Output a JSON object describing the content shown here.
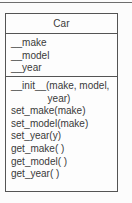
{
  "diagram": {
    "type": "uml-class-diagram",
    "top_rule_color": "#6e6e6e",
    "border_color": "#545454",
    "text_color": "#3a3a3a",
    "background_color": "#fcfcfc",
    "class": {
      "name": "Car",
      "attributes": [
        "__make",
        "__model",
        "__year"
      ],
      "methods": [
        {
          "line1": "__init__(make, model,",
          "line2": "year)",
          "wrapped": true
        },
        {
          "line1": "set_make(make)",
          "wrapped": false
        },
        {
          "line1": "set_model(make)",
          "wrapped": false
        },
        {
          "line1": "set_year(y)",
          "wrapped": false
        },
        {
          "line1": "get_make( )",
          "wrapped": false
        },
        {
          "line1": "get_model( )",
          "wrapped": false
        },
        {
          "line1": "get_year( )",
          "wrapped": false
        }
      ]
    }
  }
}
